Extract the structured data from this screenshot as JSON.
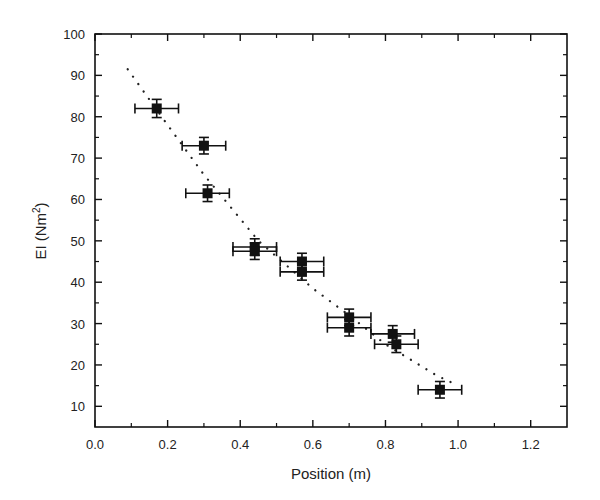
{
  "chart_data": {
    "type": "scatter",
    "title": "",
    "xlabel": "Position (m)",
    "ylabel": "EI (Nm²)",
    "ylabel_base": "EI (Nm",
    "ylabel_sup": "2",
    "ylabel_close": ")",
    "xlim": [
      0.0,
      1.3
    ],
    "ylim": [
      5,
      100
    ],
    "xticks": [
      0.0,
      0.2,
      0.4,
      0.6,
      0.8,
      1.0,
      1.2
    ],
    "xtick_labels": [
      "0.0",
      "0.2",
      "0.4",
      "0.6",
      "0.8",
      "1.0",
      "1.2"
    ],
    "yticks": [
      10,
      20,
      30,
      40,
      50,
      60,
      70,
      80,
      90,
      100
    ],
    "ytick_labels": [
      "10",
      "20",
      "30",
      "40",
      "50",
      "60",
      "70",
      "80",
      "90",
      "100"
    ],
    "grid": false,
    "legend": null,
    "series": [
      {
        "name": "measurements",
        "marker": "square",
        "color": "#111111",
        "points": [
          {
            "x": 0.17,
            "y": 82.0,
            "xerr": 0.06,
            "yerr": 2.2
          },
          {
            "x": 0.3,
            "y": 73.0,
            "xerr": 0.06,
            "yerr": 2.0
          },
          {
            "x": 0.31,
            "y": 61.5,
            "xerr": 0.06,
            "yerr": 2.0
          },
          {
            "x": 0.44,
            "y": 48.5,
            "xerr": 0.06,
            "yerr": 2.0
          },
          {
            "x": 0.44,
            "y": 47.5,
            "xerr": 0.06,
            "yerr": 2.0
          },
          {
            "x": 0.57,
            "y": 45.0,
            "xerr": 0.06,
            "yerr": 2.0
          },
          {
            "x": 0.57,
            "y": 42.5,
            "xerr": 0.06,
            "yerr": 2.0
          },
          {
            "x": 0.7,
            "y": 31.5,
            "xerr": 0.06,
            "yerr": 2.0
          },
          {
            "x": 0.7,
            "y": 29.0,
            "xerr": 0.06,
            "yerr": 2.0
          },
          {
            "x": 0.82,
            "y": 27.5,
            "xerr": 0.06,
            "yerr": 2.0
          },
          {
            "x": 0.83,
            "y": 25.0,
            "xerr": 0.06,
            "yerr": 2.0
          },
          {
            "x": 0.95,
            "y": 14.0,
            "xerr": 0.06,
            "yerr": 2.0
          }
        ]
      },
      {
        "name": "fit",
        "style": "dotted",
        "color": "#222222",
        "x": [
          0.09,
          0.2,
          0.3,
          0.45,
          0.6,
          0.7,
          0.8,
          0.94,
          1.0
        ],
        "y": [
          91.5,
          78.0,
          66.0,
          50.0,
          38.5,
          32.0,
          25.0,
          17.5,
          15.0
        ]
      }
    ]
  }
}
